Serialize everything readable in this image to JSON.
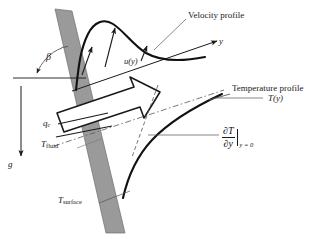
{
  "figure": {
    "background_color": "#ffffff",
    "plate_color": "#9a9a9a",
    "line_color": "#1a1a1a",
    "thin_line_color": "#555555"
  },
  "labels": {
    "velocity_profile": "Velocity profile",
    "temperature_profile": "Temperature profile",
    "temperature_function": "T(y)",
    "velocity_function": "u(y)",
    "axis_y": "y",
    "angle_beta": "β",
    "gravity": "g",
    "heat_flux_symbol": "q",
    "heat_flux_subscript": "c",
    "fluid_temp_symbol": "T",
    "fluid_temp_subscript": "fluid",
    "surface_temp_symbol": "T",
    "surface_temp_subscript": "surface",
    "gradient_numerator": "∂T",
    "gradient_denominator": "∂y",
    "gradient_condition": "y = 0"
  }
}
